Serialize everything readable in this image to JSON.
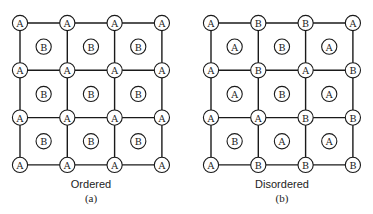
{
  "diagrams": [
    {
      "id": "ordered",
      "caption": "Ordered",
      "sublabel": "(a)",
      "origin": [
        20,
        23
      ],
      "spacing": 47.3,
      "corners": [
        [
          "A",
          "A",
          "A",
          "A"
        ],
        [
          "A",
          "A",
          "A",
          "A"
        ],
        [
          "A",
          "A",
          "A",
          "A"
        ],
        [
          "A",
          "A",
          "A",
          "A"
        ]
      ],
      "centers": [
        [
          "B",
          "B",
          "B"
        ],
        [
          "B",
          "B",
          "B"
        ],
        [
          "B",
          "B",
          "B"
        ]
      ]
    },
    {
      "id": "disordered",
      "caption": "Disordered",
      "sublabel": "(b)",
      "origin": [
        211,
        23
      ],
      "spacing": 47.3,
      "corners": [
        [
          "A",
          "B",
          "B",
          "A"
        ],
        [
          "A",
          "B",
          "A",
          "B"
        ],
        [
          "A",
          "A",
          "B",
          "B"
        ],
        [
          "A",
          "B",
          "B",
          "B"
        ]
      ],
      "centers": [
        [
          "A",
          "B",
          "A"
        ],
        [
          "A",
          "B",
          "A"
        ],
        [
          "B",
          "A",
          "A"
        ]
      ]
    }
  ],
  "colors": {
    "line": "#1a1a1a",
    "background": "#ffffff"
  }
}
